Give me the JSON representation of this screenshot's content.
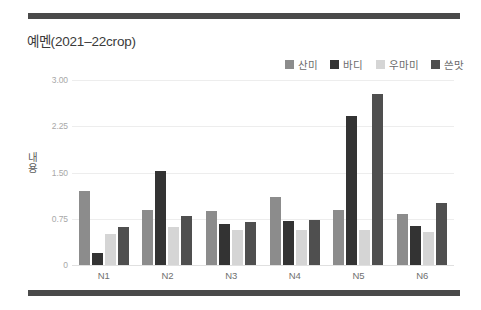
{
  "decor": {
    "top_rule_color": "#4a4a4a",
    "bottom_rule_color": "#4a4a4a"
  },
  "header": {
    "title": "예멘(2021–22crop)"
  },
  "legend": {
    "position": "top-right",
    "items": [
      {
        "label": "산미",
        "color": "#8c8c8c"
      },
      {
        "label": "바디",
        "color": "#333333"
      },
      {
        "label": "우마미",
        "color": "#d5d5d5"
      },
      {
        "label": "쓴맛",
        "color": "#4f4f4f"
      }
    ]
  },
  "axes": {
    "y_title": "내용",
    "y_title_chars": [
      "내",
      "용"
    ],
    "y_ticks": [
      "0",
      "0.75",
      "1.50",
      "2.25",
      "3.00"
    ],
    "x_ticks": [
      "N1",
      "N2",
      "N3",
      "N4",
      "N5",
      "N6"
    ]
  },
  "chart_data": {
    "type": "bar",
    "title": "예멘(2021–22crop)",
    "xlabel": "",
    "ylabel": "내용",
    "ylim": [
      0,
      3.0
    ],
    "ytick_values": [
      0,
      0.75,
      1.5,
      2.25,
      3.0
    ],
    "grid": true,
    "legend_position": "top-right",
    "categories": [
      "N1",
      "N2",
      "N3",
      "N4",
      "N5",
      "N6"
    ],
    "series": [
      {
        "name": "산미",
        "color": "#8c8c8c",
        "values": [
          1.2,
          0.9,
          0.88,
          1.1,
          0.9,
          0.82
        ]
      },
      {
        "name": "바디",
        "color": "#333333",
        "values": [
          0.2,
          1.53,
          0.67,
          0.72,
          2.42,
          0.63
        ]
      },
      {
        "name": "우마미",
        "color": "#d5d5d5",
        "values": [
          0.5,
          0.62,
          0.57,
          0.57,
          0.57,
          0.53
        ]
      },
      {
        "name": "쓴맛",
        "color": "#4f4f4f",
        "values": [
          0.62,
          0.8,
          0.7,
          0.73,
          2.78,
          1.0
        ]
      }
    ]
  }
}
